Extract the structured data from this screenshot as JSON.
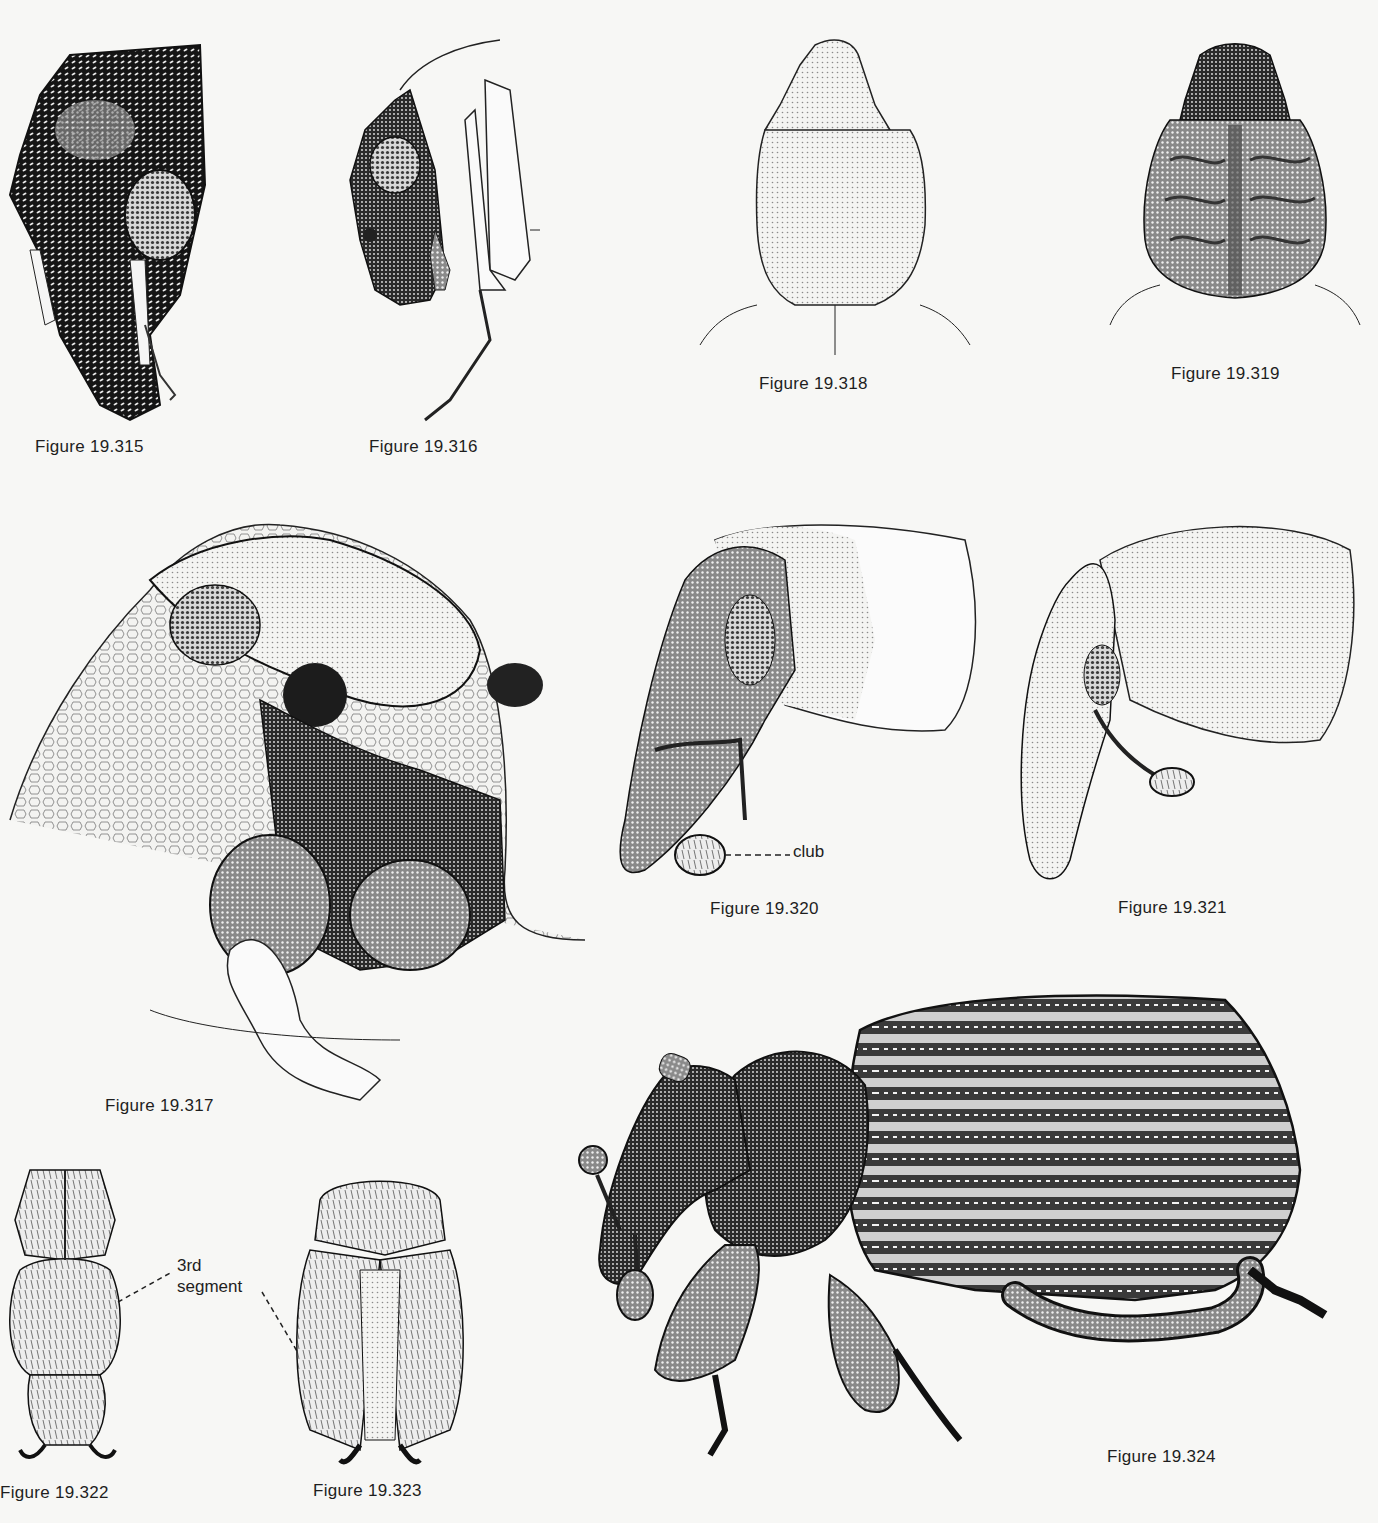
{
  "plate": {
    "figures": [
      {
        "id": "19.315",
        "caption": "Figure 19.315"
      },
      {
        "id": "19.316",
        "caption": "Figure 19.316"
      },
      {
        "id": "19.317",
        "caption": "Figure 19.317"
      },
      {
        "id": "19.318",
        "caption": "Figure 19.318"
      },
      {
        "id": "19.319",
        "caption": "Figure 19.319"
      },
      {
        "id": "19.320",
        "caption": "Figure 19.320"
      },
      {
        "id": "19.321",
        "caption": "Figure 19.321"
      },
      {
        "id": "19.322",
        "caption": "Figure 19.322"
      },
      {
        "id": "19.323",
        "caption": "Figure 19.323"
      },
      {
        "id": "19.324",
        "caption": "Figure 19.324"
      }
    ],
    "labels": {
      "club": "club",
      "third_segment_line1": "3rd",
      "third_segment_line2": "segment"
    },
    "colors": {
      "paper": "#f7f7f5",
      "ink": "#1a1a1a",
      "stipple_mid": "#5a5a5a",
      "stipple_light": "#bdbdbd"
    }
  }
}
